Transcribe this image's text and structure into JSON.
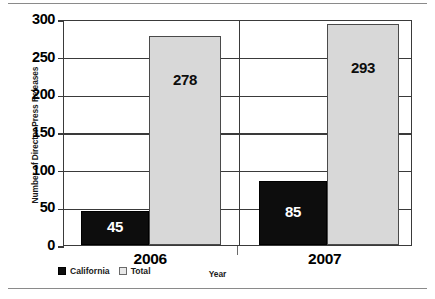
{
  "chart_data": {
    "type": "bar",
    "title": "",
    "xlabel": "Year",
    "ylabel": "Number of Director Press Releases",
    "categories": [
      "2006",
      "2007"
    ],
    "series": [
      {
        "name": "California",
        "values": [
          45,
          85
        ],
        "color": "#0d0d0d"
      },
      {
        "name": "Total",
        "values": [
          278,
          293
        ],
        "color": "#d8d8d8"
      }
    ],
    "ylim": [
      0,
      300
    ],
    "ytick_labels": [
      "300",
      "250",
      "200",
      "150",
      "100",
      "50",
      "0"
    ],
    "ytick_values": [
      300,
      250,
      200,
      150,
      100,
      50,
      0
    ],
    "grid": true,
    "legend_position": "bottom-left",
    "value_labels": [
      "45",
      "278",
      "85",
      "293"
    ]
  },
  "legend": {
    "items": [
      {
        "label": "California",
        "swatch": "black-square-swatch"
      },
      {
        "label": "Total",
        "swatch": "light-gray-square-swatch"
      }
    ]
  }
}
